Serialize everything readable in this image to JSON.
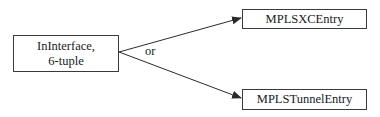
{
  "diagram": {
    "source_node": {
      "line1": "InInterface,",
      "line2": "6-tuple"
    },
    "target_nodes": [
      {
        "label": "MPLSXCEntry"
      },
      {
        "label": "MPLSTunnelEntry"
      }
    ],
    "edge_label": "or",
    "edges": [
      {
        "from": "InInterface, 6-tuple",
        "to": "MPLSXCEntry"
      },
      {
        "from": "InInterface, 6-tuple",
        "to": "MPLSTunnelEntry"
      }
    ]
  }
}
